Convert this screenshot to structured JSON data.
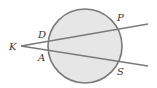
{
  "diagram": {
    "type": "circle-with-two-secants",
    "colors": {
      "circle_fill": "#e6e6e6",
      "stroke": "#7a7a7a",
      "label": "#333333",
      "background": "#ffffff"
    },
    "circle": {
      "cx": 85,
      "cy": 46,
      "r": 37
    },
    "external_point": {
      "label": "K",
      "x": 21,
      "y": 46
    },
    "secants": [
      {
        "name": "upper",
        "from": "K",
        "end_x": 148,
        "end_y": 24,
        "near_point": "D",
        "far_point": "P"
      },
      {
        "name": "lower",
        "from": "K",
        "end_x": 148,
        "end_y": 66,
        "near_point": "A",
        "far_point": "S"
      }
    ],
    "labels": {
      "K": {
        "text": "K",
        "x": 9,
        "y": 50
      },
      "D": {
        "text": "D",
        "x": 38,
        "y": 38
      },
      "A": {
        "text": "A",
        "x": 38,
        "y": 61
      },
      "P": {
        "text": "P",
        "x": 117,
        "y": 21
      },
      "S": {
        "text": "S",
        "x": 117,
        "y": 75
      }
    }
  }
}
